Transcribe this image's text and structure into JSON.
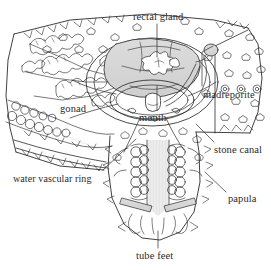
{
  "figure": {
    "background_color": "#ffffff",
    "ink_color": "#2b2b2b",
    "shade_color": "#d5d5d5",
    "width": 271,
    "height": 270
  },
  "labels": [
    {
      "id": "rectal-gland",
      "text": "rectal gland",
      "x": 133,
      "y": 11,
      "anchor": "start"
    },
    {
      "id": "madreporite",
      "text": "madreporite",
      "x": 203,
      "y": 89,
      "anchor": "start"
    },
    {
      "id": "gonad",
      "text": "gonad",
      "x": 60,
      "y": 103,
      "anchor": "start"
    },
    {
      "id": "mouth",
      "text": "mouth",
      "x": 139,
      "y": 112,
      "anchor": "start"
    },
    {
      "id": "stone-canal",
      "text": "stone canal",
      "x": 214,
      "y": 144,
      "anchor": "start"
    },
    {
      "id": "water-vascular-ring",
      "text": "water vascular ring",
      "x": 13,
      "y": 173,
      "anchor": "start"
    },
    {
      "id": "papula",
      "text": "papula",
      "x": 228,
      "y": 193,
      "anchor": "start"
    },
    {
      "id": "tube-feet",
      "text": "tube feet",
      "x": 136,
      "y": 250,
      "anchor": "start"
    }
  ],
  "leaders": [
    {
      "id": "leader-rectal-gland",
      "points": "157,24 157,57"
    },
    {
      "id": "leader-madreporite",
      "points": "202,86 202,52 213,46"
    },
    {
      "id": "leader-mouth",
      "points": "157,110 157,84"
    },
    {
      "id": "leader-stone-canal",
      "points": "214,142 196,124"
    },
    {
      "id": "leader-water-vascular-ring",
      "points": "103,170 136,139"
    },
    {
      "id": "leader-papula",
      "points": "226,192 205,172"
    },
    {
      "id": "leader-tube-feet",
      "points": "158,248 158,231"
    }
  ],
  "structures": [
    {
      "id": "pyloric-caeca",
      "name": "pyloric caeca",
      "region": "upper-left arm"
    },
    {
      "id": "gonad-beads",
      "name": "gonad",
      "region": "lower-left arm"
    },
    {
      "id": "cardiac-stomach",
      "name": "cardiac stomach",
      "region": "center"
    },
    {
      "id": "rectal-gland-star",
      "name": "rectal gland",
      "region": "center"
    },
    {
      "id": "madreporite-plate",
      "name": "madreporite",
      "region": "right disc"
    },
    {
      "id": "stone-canal-tube",
      "name": "stone canal",
      "region": "center-right"
    },
    {
      "id": "ring-canal",
      "name": "water vascular ring",
      "region": "center"
    },
    {
      "id": "tube-feet-rows",
      "name": "tube feet",
      "region": "lower arm"
    },
    {
      "id": "papulae",
      "name": "papulae",
      "region": "body wall"
    },
    {
      "id": "ossicles",
      "name": "skeletal ossicles",
      "region": "body wall"
    },
    {
      "id": "spines",
      "name": "marginal spines",
      "region": "arm margins"
    }
  ]
}
